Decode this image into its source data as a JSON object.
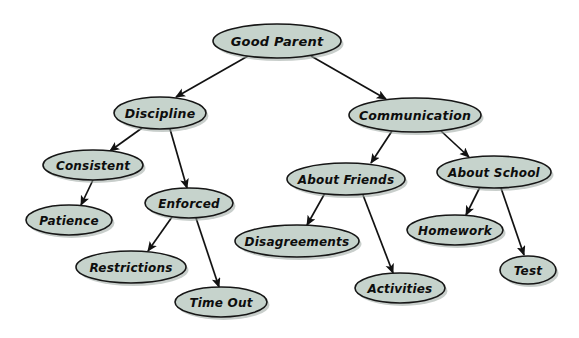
{
  "diagram": {
    "type": "concept-map",
    "background_color": "#ffffff",
    "node_fill_color": "#c6d3cc",
    "node_stroke_color": "#161616",
    "edge_color": "#121212",
    "text_color": "#0d0d0d",
    "nodes": [
      {
        "id": "good-parent",
        "label": "Good Parent",
        "cx": 277,
        "cy": 41,
        "rx": 64,
        "ry": 17,
        "font_size": 13
      },
      {
        "id": "discipline",
        "label": "Discipline",
        "cx": 160,
        "cy": 113,
        "rx": 46,
        "ry": 16,
        "font_size": 12.5
      },
      {
        "id": "communication",
        "label": "Communication",
        "cx": 415,
        "cy": 115,
        "rx": 66,
        "ry": 17,
        "font_size": 12.5
      },
      {
        "id": "consistent",
        "label": "Consistent",
        "cx": 93,
        "cy": 165,
        "rx": 50,
        "ry": 15,
        "font_size": 12
      },
      {
        "id": "enforced",
        "label": "Enforced",
        "cx": 189,
        "cy": 203,
        "rx": 44,
        "ry": 15,
        "font_size": 12
      },
      {
        "id": "patience",
        "label": "Patience",
        "cx": 69,
        "cy": 220,
        "rx": 43,
        "ry": 15,
        "font_size": 12
      },
      {
        "id": "restrictions",
        "label": "Restrictions",
        "cx": 131,
        "cy": 267,
        "rx": 55,
        "ry": 16,
        "font_size": 12
      },
      {
        "id": "time-out",
        "label": "Time Out",
        "cx": 221,
        "cy": 302,
        "rx": 46,
        "ry": 15,
        "font_size": 12
      },
      {
        "id": "about-friends",
        "label": "About Friends",
        "cx": 346,
        "cy": 179,
        "rx": 59,
        "ry": 16,
        "font_size": 12
      },
      {
        "id": "about-school",
        "label": "About School",
        "cx": 494,
        "cy": 172,
        "rx": 57,
        "ry": 16,
        "font_size": 12
      },
      {
        "id": "disagreements",
        "label": "Disagreements",
        "cx": 297,
        "cy": 241,
        "rx": 62,
        "ry": 16,
        "font_size": 12
      },
      {
        "id": "activities",
        "label": "Activities",
        "cx": 400,
        "cy": 288,
        "rx": 45,
        "ry": 15,
        "font_size": 12
      },
      {
        "id": "homework",
        "label": "Homework",
        "cx": 455,
        "cy": 230,
        "rx": 48,
        "ry": 15,
        "font_size": 12
      },
      {
        "id": "test",
        "label": "Test",
        "cx": 528,
        "cy": 270,
        "rx": 28,
        "ry": 14,
        "font_size": 12
      }
    ],
    "edges": [
      {
        "from": "good-parent",
        "to": "discipline",
        "x1": 248,
        "y1": 56,
        "x2": 176,
        "y2": 97
      },
      {
        "from": "good-parent",
        "to": "communication",
        "x1": 311,
        "y1": 56,
        "x2": 386,
        "y2": 99
      },
      {
        "from": "discipline",
        "to": "consistent",
        "x1": 142,
        "y1": 128,
        "x2": 110,
        "y2": 151
      },
      {
        "from": "discipline",
        "to": "enforced",
        "x1": 170,
        "y1": 129,
        "x2": 187,
        "y2": 188
      },
      {
        "from": "consistent",
        "to": "patience",
        "x1": 93,
        "y1": 180,
        "x2": 81,
        "y2": 205
      },
      {
        "from": "enforced",
        "to": "restrictions",
        "x1": 172,
        "y1": 217,
        "x2": 148,
        "y2": 251
      },
      {
        "from": "enforced",
        "to": "time-out",
        "x1": 196,
        "y1": 218,
        "x2": 219,
        "y2": 287
      },
      {
        "from": "communication",
        "to": "about-friends",
        "x1": 392,
        "y1": 131,
        "x2": 371,
        "y2": 163
      },
      {
        "from": "communication",
        "to": "about-school",
        "x1": 441,
        "y1": 131,
        "x2": 469,
        "y2": 157
      },
      {
        "from": "about-friends",
        "to": "disagreements",
        "x1": 325,
        "y1": 193,
        "x2": 307,
        "y2": 225
      },
      {
        "from": "about-friends",
        "to": "activities",
        "x1": 363,
        "y1": 195,
        "x2": 393,
        "y2": 273
      },
      {
        "from": "about-school",
        "to": "homework",
        "x1": 480,
        "y1": 187,
        "x2": 466,
        "y2": 215
      },
      {
        "from": "about-school",
        "to": "test",
        "x1": 501,
        "y1": 188,
        "x2": 524,
        "y2": 255
      }
    ]
  }
}
